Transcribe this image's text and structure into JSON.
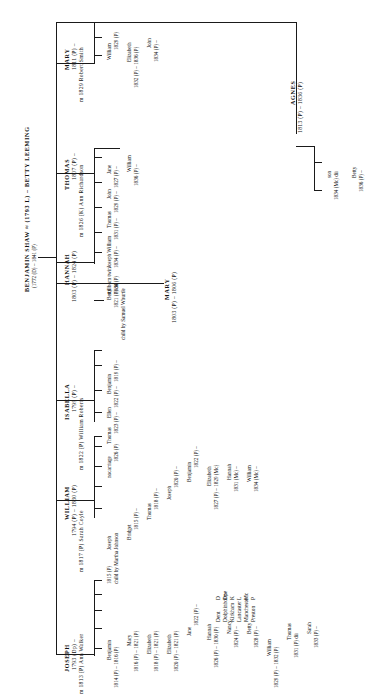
{
  "diagram": {
    "title_line1": "BENJAMIN SHAW ≈ (1793 L) –  BETTY LEEMING",
    "title_line2": "(1772 (D) – 1841 (P)",
    "orientation": "rotated-90-ccw"
  },
  "legend": {
    "title": "",
    "items": [
      {
        "key": "D",
        "place": "Dent"
      },
      {
        "key": "Dp",
        "place": "Dolphinholme"
      },
      {
        "key": "K",
        "place": "Kirkham"
      },
      {
        "key": "L",
        "place": "Lancaster"
      },
      {
        "key": "Mc",
        "place": "Manchester"
      },
      {
        "key": "P",
        "place": "Preston"
      }
    ]
  },
  "generation1": [
    {
      "id": "joseph",
      "name": "JOSEPH",
      "dates": "1793 (Dp) –",
      "marriage": "m 1813 (P) Ann Walker",
      "children": [
        {
          "name": "Benjamin",
          "dates": "1814 (P) – 1816 (P)"
        },
        {
          "name": "Mary",
          "dates": "1816 (P) – 1821 (P)"
        },
        {
          "name": "Elizabeth",
          "dates": "1818 (P) – 1821 (P)"
        },
        {
          "name": "Elizabeth",
          "dates": "1820 (P) – 1821 (P)"
        },
        {
          "name": "Jane",
          "dates": "1822 (P) –"
        },
        {
          "name": "Hannah",
          "dates": "1826 (P) – 1830 (P)"
        },
        {
          "name": "Nancy",
          "dates": "1824 (P) –"
        },
        {
          "name": "Betty",
          "dates": "1828 (P) –"
        },
        {
          "name": "William",
          "dates": "1829 (P) – 1832 (P)"
        },
        {
          "name": "Thomas",
          "dates": "1831 (P) dii"
        },
        {
          "name": "Sarah",
          "dates": "1833 (P) –"
        }
      ]
    },
    {
      "id": "william",
      "name": "WILLIAM",
      "dates": "1794 (P) – 1830 (P)",
      "marriage": "m 1817 (P) Sarah Coyle",
      "children": [
        {
          "name": "Joseph",
          "dates": "1815 (P)",
          "note": "child by Martha Johnson"
        },
        {
          "name": "Bridget",
          "dates": "1815 (P) –"
        },
        {
          "name": "Thomas",
          "dates": "1818 (P) –"
        },
        {
          "name": "Joseph",
          "dates": "1820 (P) –"
        },
        {
          "name": "Benjamin",
          "dates": "1822 (P) –"
        },
        {
          "name": "Elizabeth",
          "dates": "1827 (P) – 1829 (Mc)"
        },
        {
          "name": "Hannah",
          "dates": "1831 (Mc) –"
        },
        {
          "name": "William",
          "dates": "1834 (Mc) –"
        }
      ]
    },
    {
      "id": "isabella",
      "name": "ISABELLA",
      "dates": "1799 (P) –",
      "marriage": "m 1822 (P) William Roberts",
      "children": [
        {
          "name": "Benjamin",
          "dates": "1819 (P) –"
        },
        {
          "name": "Ellen",
          "dates": "1822 (P) –"
        },
        {
          "name": "Thomas",
          "dates": "1823 (P) –"
        },
        {
          "name": "nocarriage",
          "dates": "1826 (P)"
        }
      ]
    },
    {
      "id": "hannah",
      "name": "HANNAH",
      "dates": "1803 (P) – 1824 (P)",
      "marriage": "",
      "children": [
        {
          "name": "Betty",
          "dates": "1821 (P) dii",
          "note": "child by Samuel Whurtle"
        }
      ]
    },
    {
      "id": "mary_b1803",
      "name": "MARY",
      "dates": "1803 (P) – 1806 (P)",
      "marriage": "",
      "children": []
    },
    {
      "id": "thomas",
      "name": "THOMAS",
      "dates": "1807 (P) –",
      "marriage": "m 1826 (K) Ann Richardson",
      "children": [
        {
          "name": "Jane",
          "dates": "1827 (P) –"
        },
        {
          "name": "John",
          "dates": "1829 (P) –"
        },
        {
          "name": "Thomas",
          "dates": "1831 (P) –"
        },
        {
          "name": "Joseph William",
          "dates": "1834 (P) –"
        },
        {
          "name": "stillborn twin",
          "dates": "1834 (P)"
        },
        {
          "name": "William",
          "dates": "1836 (P) –"
        }
      ]
    },
    {
      "id": "mary_b1811",
      "name": "MARY",
      "dates": "1811 (P) –",
      "marriage": "m 1829 Robert Smith",
      "children": [
        {
          "name": "William",
          "dates": "1829 (P)"
        },
        {
          "name": "Elizabeth",
          "dates": "1832 (P) – 1836 (P)"
        },
        {
          "name": "John",
          "dates": "1834 (P) –"
        }
      ]
    },
    {
      "id": "agnes",
      "name": "AGNES",
      "dates": "1813 (P) – 1836 (P)",
      "marriage": "",
      "children": [
        {
          "name": "son",
          "dates": "1834 (Mc) dii"
        },
        {
          "name": "Betty",
          "dates": "1836 (P) –"
        }
      ]
    }
  ]
}
